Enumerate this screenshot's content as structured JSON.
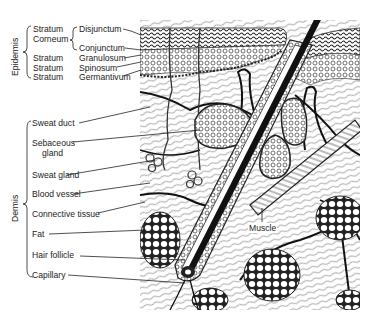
{
  "figure": {
    "groups": {
      "epidermis": "Epidermis",
      "dermis": "Dermis"
    },
    "epidermis_labels": {
      "stratum1": "Stratum",
      "corneum": "Corneum",
      "disjunctum": "Disjunctum",
      "conjunctum": "Conjunctum",
      "stratum2": "Stratum",
      "granulosum": "Granulosum",
      "stratum3": "Stratum",
      "spinosum": "Spinosum",
      "stratum4": "Stratum",
      "germantivum": "Germantivum"
    },
    "dermis_labels": {
      "sweat_duct": "Sweat duct",
      "sebaceous1": "Sebaceous",
      "sebaceous2": "gland",
      "sweat_gland": "Sweat gland",
      "blood_vessel": "Blood vessel",
      "connective_tissue": "Connective tissue",
      "fat": "Fat",
      "hair_follicle": "Hair follicle",
      "capillary": "Capillary"
    },
    "inline_labels": {
      "muscle": "Muscle"
    },
    "colors": {
      "ink": "#1a1a1a",
      "paper": "#ffffff"
    }
  }
}
